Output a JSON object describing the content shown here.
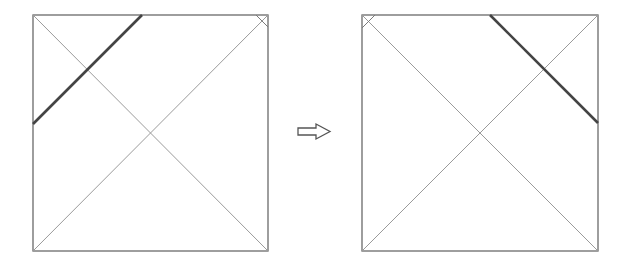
{
  "diagram": {
    "colors": {
      "frame": "#6a6a6a",
      "diagonal": "#9a9a9a",
      "thick_line": "#444444",
      "arrow": "#555555",
      "background": "#ffffff"
    },
    "panels": [
      {
        "id": "before",
        "square": {
          "x": 33,
          "y": 15,
          "size": 235
        },
        "thick_line": {
          "x1": 33,
          "y1": 124,
          "x2": 142,
          "y2": 15
        },
        "corner_mark": "top-right"
      },
      {
        "id": "after",
        "square": {
          "x": 362,
          "y": 15,
          "size": 236
        },
        "thick_line": {
          "x1": 490,
          "y1": 15,
          "x2": 598,
          "y2": 123
        },
        "corner_mark": "top-left"
      }
    ],
    "arrow": {
      "direction": "right",
      "icon": "outlined-right-arrow"
    }
  }
}
